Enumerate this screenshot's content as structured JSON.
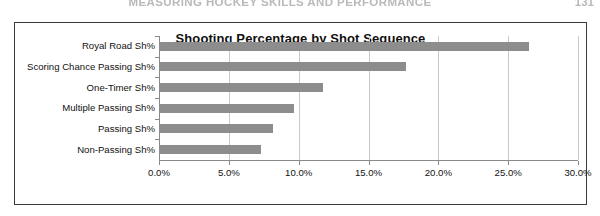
{
  "page": {
    "running_head": "MEASURING HOCKEY SKILLS AND PERFORMANCE",
    "page_number": "131"
  },
  "chart_data": {
    "type": "bar",
    "orientation": "horizontal",
    "title": "Shooting Percentage by Shot Sequence",
    "xlabel": "",
    "ylabel": "",
    "categories": [
      "Royal Road Sh%",
      "Scoring Chance Passing Sh%",
      "One-Timer Sh%",
      "Multiple Passing Sh%",
      "Passing Sh%",
      "Non-Passing Sh%"
    ],
    "values": [
      26.4,
      17.6,
      11.7,
      9.6,
      8.1,
      7.2
    ],
    "value_format": "percent",
    "xlim": [
      0,
      30
    ],
    "xticks": [
      0,
      5,
      10,
      15,
      20,
      25,
      30
    ],
    "xtick_labels": [
      "0.0%",
      "5.0%",
      "10.0%",
      "15.0%",
      "20.0%",
      "25.0%",
      "30.0%"
    ],
    "grid": "vertical",
    "legend": "none",
    "bar_color": "#8d8d8d",
    "gridline_color": "#c9c9c9",
    "axis_color": "#8a8a8a",
    "frame_color": "#3a3a3a",
    "background": "#ffffff"
  }
}
